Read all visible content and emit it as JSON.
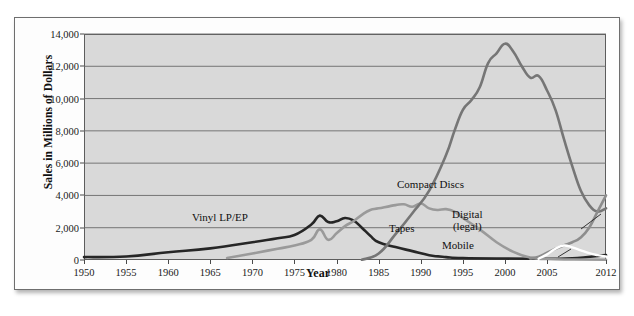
{
  "chart_data": {
    "type": "line",
    "title": "",
    "xlabel": "Year",
    "ylabel": "Sales in Millions of Dollars",
    "xlim": [
      1950,
      2012
    ],
    "ylim": [
      0,
      14000
    ],
    "grid": true,
    "legend_position": "inline-annotations",
    "x_ticks": [
      "1950",
      "1955",
      "1960",
      "1965",
      "1970",
      "1975",
      "1980",
      "1985",
      "1990",
      "1995",
      "2000",
      "2005",
      "2012"
    ],
    "x_tick_values": [
      1950,
      1955,
      1960,
      1965,
      1970,
      1975,
      1980,
      1985,
      1990,
      1995,
      2000,
      2005,
      2012
    ],
    "y_ticks": [
      "0",
      "2,000",
      "4,000",
      "6,000",
      "8,000",
      "10,000",
      "12,000",
      "14,000"
    ],
    "y_tick_values": [
      0,
      2000,
      4000,
      6000,
      8000,
      10000,
      12000,
      14000
    ],
    "series": [
      {
        "name": "Vinyl LP/EP",
        "color": "#262626",
        "x": [
          1950,
          1955,
          1960,
          1965,
          1970,
          1973,
          1975,
          1977,
          1978,
          1979,
          1980,
          1981,
          1982,
          1983,
          1984,
          1985,
          1987,
          1989,
          1991,
          1993,
          1995,
          2000,
          2005,
          2008,
          2012
        ],
        "values": [
          180,
          220,
          480,
          720,
          1100,
          1350,
          1550,
          2200,
          2750,
          2350,
          2400,
          2600,
          2450,
          2000,
          1500,
          1100,
          800,
          550,
          300,
          180,
          120,
          90,
          80,
          100,
          300
        ]
      },
      {
        "name": "Tapes",
        "color": "#9a9a9a",
        "x": [
          1967,
          1970,
          1973,
          1975,
          1977,
          1978,
          1979,
          1980,
          1981,
          1982,
          1983,
          1984,
          1985,
          1987,
          1988,
          1989,
          1990,
          1991,
          1992,
          1993,
          1994,
          1995,
          1997,
          1999,
          2001,
          2003,
          2005,
          2008,
          2012
        ],
        "values": [
          120,
          400,
          700,
          900,
          1250,
          1900,
          1250,
          1650,
          2100,
          2400,
          2800,
          3100,
          3200,
          3400,
          3450,
          3300,
          3500,
          3200,
          3100,
          3150,
          3000,
          2600,
          1900,
          1100,
          500,
          150,
          60,
          30,
          20
        ]
      },
      {
        "name": "Compact Discs",
        "color": "#767676",
        "x": [
          1983,
          1985,
          1987,
          1989,
          1991,
          1993,
          1994,
          1995,
          1996,
          1997,
          1998,
          1999,
          2000,
          2001,
          2002,
          2003,
          2004,
          2005,
          2006,
          2007,
          2008,
          2009,
          2010,
          2011,
          2012
        ],
        "values": [
          20,
          400,
          1600,
          2900,
          4300,
          6500,
          8000,
          9300,
          9900,
          10700,
          12200,
          12800,
          13400,
          12900,
          12000,
          11300,
          11400,
          10500,
          9300,
          7500,
          5800,
          4300,
          3400,
          3000,
          3200
        ]
      },
      {
        "name": "Digital (legal)",
        "color": "#8d8d8d",
        "x": [
          2003,
          2004,
          2005,
          2006,
          2007,
          2008,
          2009,
          2010,
          2011,
          2012
        ],
        "values": [
          100,
          200,
          450,
          700,
          900,
          1100,
          1400,
          2000,
          3000,
          4000
        ]
      },
      {
        "name": "Mobile",
        "color": "#ffffff",
        "x": [
          2004,
          2005,
          2006,
          2007,
          2008,
          2009,
          2010,
          2011,
          2012
        ],
        "values": [
          80,
          350,
          700,
          900,
          780,
          600,
          420,
          300,
          220
        ]
      }
    ],
    "annotations": [
      {
        "label": "Vinyl LP/EP",
        "lines": [
          "Vinyl LP/EP"
        ]
      },
      {
        "label": "Tapes",
        "lines": [
          "Tapes"
        ]
      },
      {
        "label": "Compact Discs",
        "lines": [
          "Compact Discs"
        ]
      },
      {
        "label": "Digital (legal)",
        "lines": [
          "Digital",
          "(legal)"
        ]
      },
      {
        "label": "Mobile",
        "lines": [
          "Mobile"
        ]
      }
    ]
  }
}
